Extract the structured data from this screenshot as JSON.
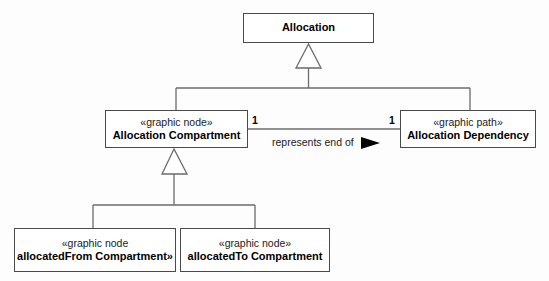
{
  "diagram": {
    "type": "uml-class-diagram",
    "classes": [
      {
        "id": "allocation",
        "stereotype": "",
        "name": "Allocation",
        "x": 243,
        "y": 13,
        "w": 131,
        "h": 30
      },
      {
        "id": "allocation-compartment",
        "stereotype": "«graphic node»",
        "name": "Allocation Compartment",
        "x": 105,
        "y": 110,
        "w": 143,
        "h": 38
      },
      {
        "id": "allocation-dependency",
        "stereotype": "«graphic path»",
        "name": "Allocation Dependency",
        "x": 400,
        "y": 110,
        "w": 136,
        "h": 38
      },
      {
        "id": "allocated-from-compartment",
        "stereotype": "«graphic node",
        "name": "allocatedFrom Compartment»",
        "x": 14,
        "y": 228,
        "w": 162,
        "h": 44
      },
      {
        "id": "allocated-to-compartment",
        "stereotype": "«graphic node»",
        "name": "allocatedTo Compartment",
        "x": 180,
        "y": 228,
        "w": 150,
        "h": 44
      }
    ],
    "association": {
      "label": "represents end of",
      "source_multiplicity": "1",
      "target_multiplicity": "1",
      "navigation_marker": "solid-triangle-right"
    },
    "generalizations": [
      {
        "id": "gen-to-allocation",
        "parent": "allocation",
        "children": [
          "allocation-compartment",
          "allocation-dependency"
        ],
        "arrowhead": "hollow-triangle-up"
      },
      {
        "id": "gen-to-allocation-compartment",
        "parent": "allocation-compartment",
        "children": [
          "allocated-from-compartment",
          "allocated-to-compartment"
        ],
        "arrowhead": "hollow-triangle-up"
      }
    ],
    "colors": {
      "border": "#4a4a4a",
      "line": "#6b6b6b",
      "text": "#000000",
      "background": "#fdfdfd",
      "marker_fill": "#000000"
    }
  }
}
